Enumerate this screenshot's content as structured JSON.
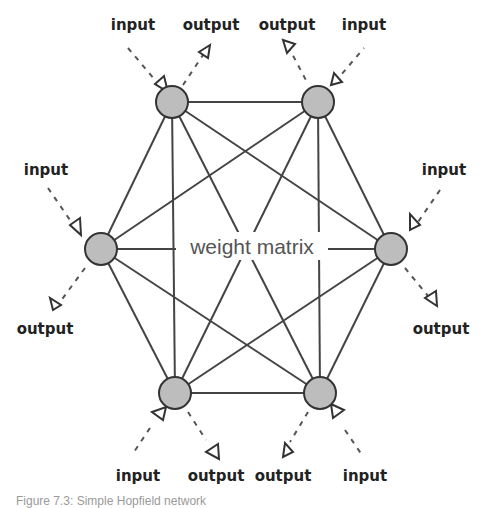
{
  "diagram": {
    "title": "Simple Hopfield network",
    "center_label": "weight matrix",
    "node_color": "#bdbdbd",
    "edge_color": "#444444",
    "nodes": [
      {
        "id": "top-left",
        "x": 172,
        "y": 102
      },
      {
        "id": "top-right",
        "x": 318,
        "y": 102
      },
      {
        "id": "left",
        "x": 101,
        "y": 249
      },
      {
        "id": "right",
        "x": 391,
        "y": 249
      },
      {
        "id": "bottom-left",
        "x": 175,
        "y": 393
      },
      {
        "id": "bottom-right",
        "x": 320,
        "y": 393
      }
    ],
    "edges": "fully connected (all 15 pairs)",
    "labels": {
      "top_left_input": "input",
      "top_left_output": "output",
      "top_right_output": "output",
      "top_right_input": "input",
      "left_input": "input",
      "left_output": "output",
      "right_input": "input",
      "right_output": "output",
      "bottom_left_input": "input",
      "bottom_left_output": "output",
      "bottom_right_output": "output",
      "bottom_right_input": "input"
    }
  },
  "caption": "Figure 7.3: Simple Hopfield network"
}
